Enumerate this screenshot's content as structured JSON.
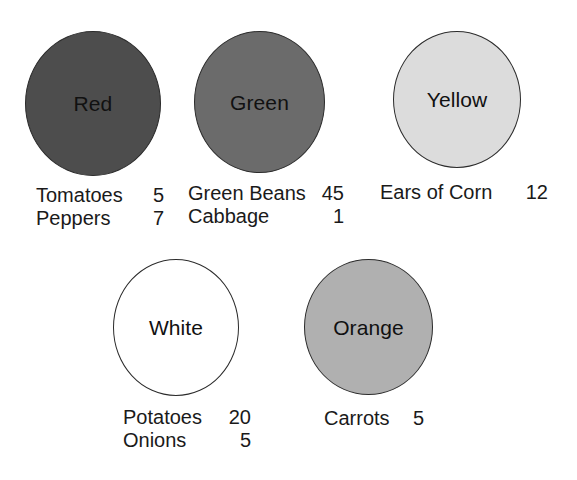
{
  "diagram": {
    "type": "color-group-circles",
    "background_color": "#ffffff",
    "text_color": "#1a1a1a",
    "groups": [
      {
        "id": "red",
        "label": "Red",
        "fill_color": "#4d4d4d",
        "stroke_color": "#2b2b2b",
        "items": [
          {
            "name": "Tomatoes",
            "value": "5"
          },
          {
            "name": "Peppers",
            "value": "7"
          }
        ]
      },
      {
        "id": "green",
        "label": "Green",
        "fill_color": "#6b6b6b",
        "stroke_color": "#2b2b2b",
        "items": [
          {
            "name": "Green Beans",
            "value": "45"
          },
          {
            "name": "Cabbage",
            "value": "1"
          }
        ]
      },
      {
        "id": "yellow",
        "label": "Yellow",
        "fill_color": "#dcdcdc",
        "stroke_color": "#2b2b2b",
        "items": [
          {
            "name": "Ears of Corn",
            "value": "12"
          }
        ]
      },
      {
        "id": "white",
        "label": "White",
        "fill_color": "#ffffff",
        "stroke_color": "#2b2b2b",
        "items": [
          {
            "name": "Potatoes",
            "value": "20"
          },
          {
            "name": "Onions",
            "value": "5"
          }
        ]
      },
      {
        "id": "orange",
        "label": "Orange",
        "fill_color": "#b0b0b0",
        "stroke_color": "#2b2b2b",
        "items": [
          {
            "name": "Carrots",
            "value": "5"
          }
        ]
      }
    ]
  }
}
